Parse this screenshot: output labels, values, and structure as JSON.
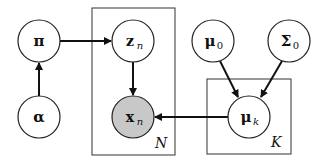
{
  "diagram": {
    "type": "probabilistic-graphical-model",
    "colors": {
      "stroke": "#222222",
      "observed_fill": "#c8c8c8",
      "latent_fill": "#ffffff"
    },
    "nodes": [
      {
        "id": "pi",
        "symbol": "π",
        "sub": "",
        "x": 39,
        "y": 41,
        "observed": false
      },
      {
        "id": "alpha",
        "symbol": "α",
        "sub": "",
        "x": 39,
        "y": 117,
        "observed": false
      },
      {
        "id": "z_n",
        "symbol": "z",
        "sub": "n",
        "x": 133,
        "y": 41,
        "observed": false
      },
      {
        "id": "x_n",
        "symbol": "x",
        "sub": "n",
        "x": 133,
        "y": 117,
        "observed": true
      },
      {
        "id": "mu_0",
        "symbol": "μ",
        "sub": "0",
        "x": 213,
        "y": 41,
        "observed": false
      },
      {
        "id": "Sigma_0",
        "symbol": "Σ",
        "sub": "0",
        "x": 289,
        "y": 41,
        "observed": false
      },
      {
        "id": "mu_k",
        "symbol": "μ",
        "sub": "k",
        "x": 249,
        "y": 117,
        "observed": false
      }
    ],
    "edges": [
      {
        "from": "alpha",
        "to": "pi"
      },
      {
        "from": "pi",
        "to": "z_n"
      },
      {
        "from": "z_n",
        "to": "x_n"
      },
      {
        "from": "mu_0",
        "to": "mu_k"
      },
      {
        "from": "Sigma_0",
        "to": "mu_k"
      },
      {
        "from": "mu_k",
        "to": "x_n"
      }
    ],
    "plates": [
      {
        "id": "plate-N",
        "label": "N",
        "x": 92,
        "y": 8,
        "w": 83,
        "h": 147
      },
      {
        "id": "plate-K",
        "label": "K",
        "x": 207,
        "y": 79,
        "w": 84,
        "h": 75
      }
    ]
  }
}
